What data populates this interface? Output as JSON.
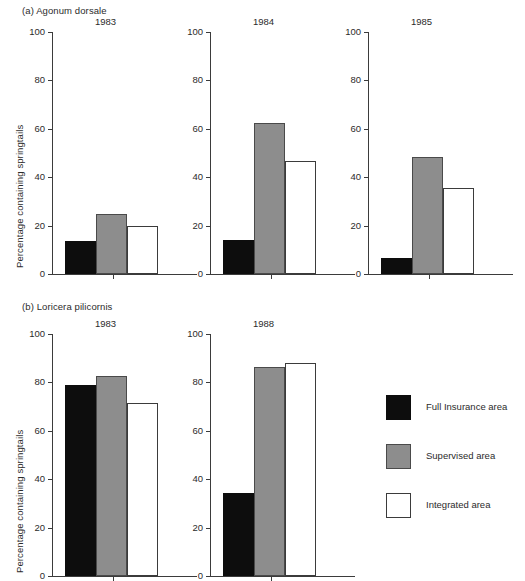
{
  "figure": {
    "groups": [
      {
        "id": "a",
        "caption": "(a) Agonum dorsale"
      },
      {
        "id": "b",
        "caption": "(b) Loricera pilicornis"
      }
    ],
    "y_axis_label": "Percentage containing springtails",
    "y_ticks": [
      "0",
      "20",
      "40",
      "60",
      "80",
      "100"
    ]
  },
  "legend": {
    "items": [
      {
        "label": "Full Insurance area",
        "color": "#0d0d0d",
        "swatch": "black"
      },
      {
        "label": "Supervised area",
        "color": "#8d8d8d",
        "swatch": "grey"
      },
      {
        "label": "Integrated area",
        "color": "#ffffff",
        "swatch": "white"
      }
    ]
  },
  "chart_data": {
    "type": "bar",
    "xlabel": "",
    "ylabel": "Percentage containing springtails",
    "ylim": [
      0,
      100
    ],
    "yticks": [
      0,
      20,
      40,
      60,
      80,
      100
    ],
    "grid": false,
    "legend_position": "right",
    "categories": [
      "Full Insurance area",
      "Supervised area",
      "Integrated area"
    ],
    "panels": [
      {
        "group": "(a) Agonum dorsale",
        "title": "1983",
        "values": [
          13.5,
          25.0,
          20.0
        ]
      },
      {
        "group": "(a) Agonum dorsale",
        "title": "1984",
        "values": [
          14.0,
          62.5,
          46.5
        ]
      },
      {
        "group": "(a) Agonum dorsale",
        "title": "1985",
        "values": [
          6.5,
          48.5,
          35.5
        ]
      },
      {
        "group": "(b) Loricera pilicornis",
        "title": "1983",
        "values": [
          79.0,
          82.5,
          71.5
        ]
      },
      {
        "group": "(b) Loricera pilicornis",
        "title": "1988",
        "values": [
          34.5,
          86.5,
          88.0
        ]
      }
    ]
  },
  "panel_titles": {
    "p0": "1983",
    "p1": "1984",
    "p2": "1985",
    "p3": "1983",
    "p4": "1988"
  }
}
